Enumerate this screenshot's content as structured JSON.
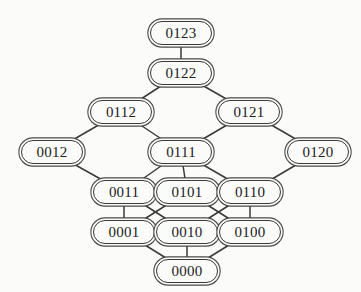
{
  "diagram": {
    "type": "lattice-graph",
    "background_color": "#fbfbf9",
    "node_fill_color": "#fbfbf9",
    "node_border_color": "#3a3a3a",
    "edge_color": "#3a3a3a",
    "text_color": "#1d1d1d",
    "node_width": 62,
    "node_height": 24,
    "font_size": 15,
    "nodes": [
      {
        "id": "0123",
        "label": "0123",
        "x": 181,
        "y": 33,
        "level": 0
      },
      {
        "id": "0122",
        "label": "0122",
        "x": 181,
        "y": 73,
        "level": 1
      },
      {
        "id": "0112",
        "label": "0112",
        "x": 121,
        "y": 112,
        "level": 2
      },
      {
        "id": "0121",
        "label": "0121",
        "x": 249,
        "y": 112,
        "level": 2
      },
      {
        "id": "0012",
        "label": "0012",
        "x": 52,
        "y": 152,
        "level": 3
      },
      {
        "id": "0111",
        "label": "0111",
        "x": 181,
        "y": 152,
        "level": 3
      },
      {
        "id": "0120",
        "label": "0120",
        "x": 318,
        "y": 152,
        "level": 3
      },
      {
        "id": "0011",
        "label": "0011",
        "x": 124,
        "y": 192,
        "level": 4
      },
      {
        "id": "0101",
        "label": "0101",
        "x": 187,
        "y": 192,
        "level": 4
      },
      {
        "id": "0110",
        "label": "0110",
        "x": 250,
        "y": 192,
        "level": 4
      },
      {
        "id": "0001",
        "label": "0001",
        "x": 124,
        "y": 232,
        "level": 5
      },
      {
        "id": "0010",
        "label": "0010",
        "x": 187,
        "y": 232,
        "level": 5
      },
      {
        "id": "0100",
        "label": "0100",
        "x": 250,
        "y": 232,
        "level": 5
      },
      {
        "id": "0000",
        "label": "0000",
        "x": 187,
        "y": 271,
        "level": 6
      }
    ],
    "edges": [
      {
        "from": "0123",
        "to": "0122"
      },
      {
        "from": "0122",
        "to": "0112"
      },
      {
        "from": "0122",
        "to": "0121"
      },
      {
        "from": "0112",
        "to": "0012"
      },
      {
        "from": "0112",
        "to": "0111"
      },
      {
        "from": "0121",
        "to": "0111"
      },
      {
        "from": "0121",
        "to": "0120"
      },
      {
        "from": "0012",
        "to": "0011"
      },
      {
        "from": "0111",
        "to": "0011"
      },
      {
        "from": "0111",
        "to": "0101"
      },
      {
        "from": "0111",
        "to": "0110"
      },
      {
        "from": "0120",
        "to": "0110"
      },
      {
        "from": "0011",
        "to": "0001"
      },
      {
        "from": "0011",
        "to": "0010"
      },
      {
        "from": "0101",
        "to": "0001"
      },
      {
        "from": "0101",
        "to": "0100"
      },
      {
        "from": "0110",
        "to": "0010"
      },
      {
        "from": "0110",
        "to": "0100"
      },
      {
        "from": "0001",
        "to": "0000"
      },
      {
        "from": "0010",
        "to": "0000"
      },
      {
        "from": "0100",
        "to": "0000"
      }
    ]
  }
}
